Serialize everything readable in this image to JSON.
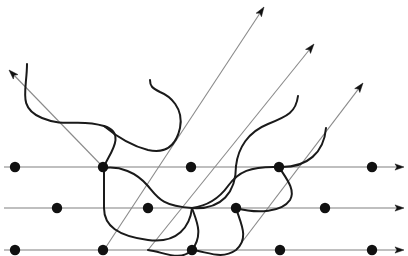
{
  "figure": {
    "title": "",
    "width": 408,
    "height": 256,
    "background": "#ffffff"
  },
  "style": {
    "horizontal_line_color": "#808080",
    "horizontal_line_width": 1.1,
    "diagonal_line_color": "#8a8a8a",
    "diagonal_line_width": 1.1,
    "wave_color": "#1a1a1a",
    "wave_width": 2.0,
    "dot_color": "#111111",
    "dot_radius": 5.2,
    "arrow_color": "#111111"
  },
  "chart_data": {
    "type": "line",
    "title": "",
    "xlabel": "",
    "ylabel": "",
    "xlim": [
      0,
      408
    ],
    "ylim": [
      256,
      0
    ],
    "grid": false,
    "legend": null,
    "horizontal_axes": [
      {
        "name": "upper-horizontal-axis",
        "y": 167,
        "x_start": 4,
        "x_end": 404,
        "arrowhead": "right",
        "dots_x": [
          15,
          103,
          191,
          279,
          372
        ]
      },
      {
        "name": "middle-horizontal-axis",
        "y": 208,
        "x_start": 4,
        "x_end": 404,
        "arrowhead": "right",
        "dots_x": [
          57,
          148,
          236,
          325
        ]
      },
      {
        "name": "lower-horizontal-axis",
        "y": 250,
        "x_start": 4,
        "x_end": 404,
        "arrowhead": "right",
        "dots_x": [
          15,
          103,
          192,
          280,
          372
        ]
      }
    ],
    "diagonal_axes": [
      {
        "name": "diagonal-arrow-upper-left",
        "x_start": 104,
        "y_start": 168,
        "x_end": 9,
        "y_end": 70,
        "arrowhead": "up-left"
      },
      {
        "name": "diagonal-arrow-1",
        "x_start": 104,
        "y_start": 250,
        "x_end": 264,
        "y_end": 7,
        "arrowhead": "up-right"
      },
      {
        "name": "diagonal-arrow-2",
        "x_start": 148,
        "y_start": 250,
        "x_end": 314,
        "y_end": 44,
        "arrowhead": "up-right"
      },
      {
        "name": "diagonal-arrow-3",
        "x_start": 236,
        "y_start": 250,
        "x_end": 363,
        "y_end": 83,
        "arrowhead": "up-right"
      }
    ],
    "wave_strands": [
      {
        "name": "wave-strand-1",
        "path": "M 27 64 C 27 90, 17 108, 42 118 C 66 128, 78 118, 104 126 C 130 134, 104 160, 104 168 C 104 182, 104 190, 104 208 C 104 226, 118 236, 148 240 C 178 244, 190 226, 192 208"
      },
      {
        "name": "wave-strand-2",
        "path": "M 104 126 C 116 136, 132 146, 148 150 C 166 154, 176 146, 180 128 C 184 108, 170 96, 160 92 C 152 88, 150 86, 150 80"
      },
      {
        "name": "wave-strand-3",
        "path": "M 104 168 C 120 166, 136 172, 148 186 C 158 198, 162 206, 192 208 C 222 210, 236 192, 236 166"
      },
      {
        "name": "wave-strand-4",
        "path": "M 192 208 C 196 220, 204 234, 192 250 C 180 262, 164 252, 148 250"
      },
      {
        "name": "wave-strand-5",
        "path": "M 236 166 C 238 148, 248 132, 268 124 C 288 116, 296 112, 298 96"
      },
      {
        "name": "wave-strand-6",
        "path": "M 192 208 C 206 206, 218 200, 228 186 C 238 172, 250 166, 279 167 C 308 168, 324 152, 326 128"
      },
      {
        "name": "wave-strand-7",
        "path": "M 236 208 C 240 222, 250 238, 236 250 C 222 260, 208 252, 192 250"
      },
      {
        "name": "wave-strand-8",
        "path": "M 279 167 C 286 178, 296 190, 290 200 C 282 212, 258 214, 236 208"
      }
    ],
    "lattice_dots": [
      {
        "x": 15,
        "y": 167
      },
      {
        "x": 103,
        "y": 167
      },
      {
        "x": 191,
        "y": 167
      },
      {
        "x": 279,
        "y": 167
      },
      {
        "x": 372,
        "y": 167
      },
      {
        "x": 57,
        "y": 208
      },
      {
        "x": 148,
        "y": 208
      },
      {
        "x": 236,
        "y": 208
      },
      {
        "x": 325,
        "y": 208
      },
      {
        "x": 15,
        "y": 250
      },
      {
        "x": 103,
        "y": 250
      },
      {
        "x": 192,
        "y": 250
      },
      {
        "x": 280,
        "y": 250
      },
      {
        "x": 372,
        "y": 250
      }
    ]
  }
}
